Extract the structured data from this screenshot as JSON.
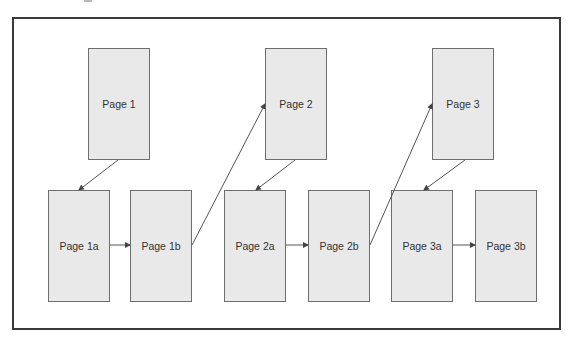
{
  "diagram": {
    "type": "page-navigation-flow",
    "pages": [
      {
        "id": "p1",
        "label": "Page 1",
        "x": 88,
        "y": 48,
        "w": 62,
        "h": 112
      },
      {
        "id": "p2",
        "label": "Page 2",
        "x": 265,
        "y": 48,
        "w": 62,
        "h": 112
      },
      {
        "id": "p3",
        "label": "Page 3",
        "x": 432,
        "y": 48,
        "w": 62,
        "h": 112
      },
      {
        "id": "p1a",
        "label": "Page 1a",
        "x": 48,
        "y": 190,
        "w": 62,
        "h": 112
      },
      {
        "id": "p1b",
        "label": "Page 1b",
        "x": 130,
        "y": 190,
        "w": 62,
        "h": 112
      },
      {
        "id": "p2a",
        "label": "Page 2a",
        "x": 224,
        "y": 190,
        "w": 62,
        "h": 112
      },
      {
        "id": "p2b",
        "label": "Page 2b",
        "x": 308,
        "y": 190,
        "w": 62,
        "h": 112
      },
      {
        "id": "p3a",
        "label": "Page 3a",
        "x": 391,
        "y": 190,
        "w": 62,
        "h": 112
      },
      {
        "id": "p3b",
        "label": "Page 3b",
        "x": 475,
        "y": 190,
        "w": 62,
        "h": 112
      }
    ],
    "edges": [
      {
        "from": "Page 1",
        "to": "Page 1a",
        "x1": 118,
        "y1": 160,
        "x2": 79,
        "y2": 190
      },
      {
        "from": "Page 1a",
        "to": "Page 1b",
        "x1": 110,
        "y1": 245,
        "x2": 130,
        "y2": 245
      },
      {
        "from": "Page 1b",
        "to": "Page 2",
        "x1": 192,
        "y1": 245,
        "x2": 265,
        "y2": 104
      },
      {
        "from": "Page 2",
        "to": "Page 2a",
        "x1": 295,
        "y1": 160,
        "x2": 256,
        "y2": 190
      },
      {
        "from": "Page 2a",
        "to": "Page 2b",
        "x1": 286,
        "y1": 245,
        "x2": 308,
        "y2": 245
      },
      {
        "from": "Page 2b",
        "to": "Page 3",
        "x1": 370,
        "y1": 245,
        "x2": 432,
        "y2": 104
      },
      {
        "from": "Page 3",
        "to": "Page 3a",
        "x1": 465,
        "y1": 160,
        "x2": 424,
        "y2": 190
      },
      {
        "from": "Page 3a",
        "to": "Page 3b",
        "x1": 453,
        "y1": 245,
        "x2": 475,
        "y2": 245
      }
    ],
    "colors": {
      "frame_border": "#3a3a3a",
      "page_fill": "#e9e9e9",
      "page_border": "#6e6e6e",
      "text": "#333333",
      "edge": "#555555"
    }
  }
}
